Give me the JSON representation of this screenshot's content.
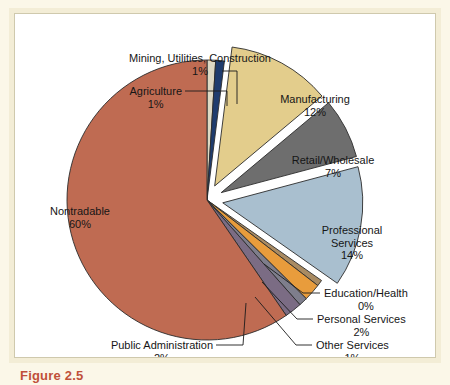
{
  "figure": {
    "caption_label": "Figure 2.5",
    "background_color": "#fbf7e8",
    "frame_color": "#f3edd6",
    "plot_background": "#ffffff",
    "caption_color": "#c0503a"
  },
  "chart_data": {
    "type": "pie",
    "title": "",
    "xlabel": "",
    "ylabel": "",
    "legend_position": "callout-labels",
    "grid": false,
    "value_unit": "percent",
    "categories": [
      "Mining, Utilities, Construction",
      "Manufacturing",
      "Retail/Wholesale",
      "Professional Services",
      "Education/Health",
      "Personal Services",
      "Other Services",
      "Public Administration",
      "Nontradable",
      "Agriculture"
    ],
    "values": [
      1,
      12,
      7,
      14,
      0,
      2,
      1,
      2,
      60,
      1
    ],
    "slices": [
      {
        "label": "Agriculture",
        "value_label": "1%",
        "value": 1,
        "color": "#ded9c4",
        "exploded": false,
        "label_x": 167,
        "label_y": 71,
        "label_align": "right",
        "leader": [
          [
            170,
            77
          ],
          [
            212,
            77
          ],
          [
            212,
            92
          ]
        ]
      },
      {
        "label": "Mining, Utilities, Construction",
        "value_label": "1%",
        "value": 1,
        "color": "#1f3c6e",
        "exploded": false,
        "label_x": 185,
        "label_y": 38,
        "label_align": "center",
        "leader": [
          [
            207,
            57
          ],
          [
            222,
            57
          ],
          [
            222,
            90
          ]
        ]
      },
      {
        "label": "Manufacturing",
        "value_label": "12%",
        "value": 12,
        "color": "#e3cd8c",
        "exploded": true,
        "label_x": 300,
        "label_y": 79,
        "label_align": "center",
        "leader": []
      },
      {
        "label": "Retail/Wholesale",
        "value_label": "7%",
        "value": 7,
        "color": "#6e6e6e",
        "exploded": true,
        "label_x": 318,
        "label_y": 140,
        "label_align": "center",
        "leader": []
      },
      {
        "label": "Professional Services",
        "value_label": "14%",
        "value": 14,
        "color": "#a9bfcf",
        "exploded": true,
        "label_x": 337,
        "label_y": 210,
        "label_align": "center",
        "leader": []
      },
      {
        "label": "Education/Health",
        "value_label": "0%",
        "value": 0,
        "color": "#a98b62",
        "exploded": false,
        "label_x": 309,
        "label_y": 273,
        "label_align": "left",
        "leader": [
          [
            305,
            279
          ],
          [
            288,
            279
          ],
          [
            249,
            250
          ]
        ]
      },
      {
        "label": "Personal Services",
        "value_label": "2%",
        "value": 2,
        "color": "#e89c3c",
        "exploded": false,
        "label_x": 302,
        "label_y": 299,
        "label_align": "left",
        "leader": [
          [
            298,
            305
          ],
          [
            282,
            305
          ],
          [
            247,
            268
          ]
        ]
      },
      {
        "label": "Other Services",
        "value_label": "1%",
        "value": 1,
        "color": "#7e7e8c",
        "exploded": false,
        "label_x": 301,
        "label_y": 325,
        "label_align": "left",
        "leader": [
          [
            297,
            331
          ],
          [
            281,
            331
          ],
          [
            240,
            283
          ]
        ]
      },
      {
        "label": "Public Administration",
        "value_label": "2%",
        "value": 2,
        "color": "#7b6c84",
        "exploded": false,
        "label_x": 198,
        "label_y": 325,
        "label_align": "right",
        "leader": [
          [
            201,
            331
          ],
          [
            228,
            331
          ],
          [
            231,
            289
          ]
        ]
      },
      {
        "label": "Nontradable",
        "value_label": "60%",
        "value": 60,
        "color": "#bf6b52",
        "exploded": false,
        "label_x": 65,
        "label_y": 191,
        "label_align": "center",
        "leader": []
      }
    ]
  }
}
